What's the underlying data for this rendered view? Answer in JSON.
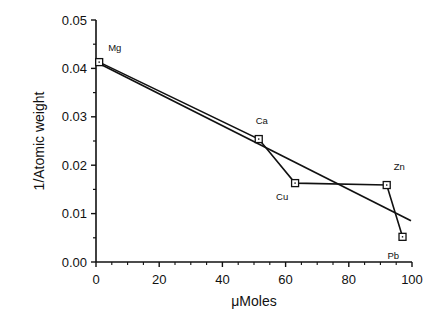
{
  "chart_data": {
    "type": "line",
    "title": "",
    "xlabel": "μMoles",
    "ylabel": "1/Atomic weight",
    "xlim": [
      0,
      100
    ],
    "ylim": [
      0.0,
      0.05
    ],
    "x_ticks": [
      "0",
      "20",
      "40",
      "60",
      "80",
      "100"
    ],
    "y_ticks": [
      "0.00",
      "0.01",
      "0.02",
      "0.03",
      "0.04",
      "0.05"
    ],
    "grid": false,
    "legend": null,
    "series": [
      {
        "name": "Metals",
        "style": "line with open square markers",
        "points": [
          {
            "label": "Mg",
            "x": 1,
            "y": 0.0413
          },
          {
            "label": "Ca",
            "x": 51.5,
            "y": 0.0254
          },
          {
            "label": "Cu",
            "x": 63,
            "y": 0.0163
          },
          {
            "label": "Zn",
            "x": 92,
            "y": 0.0159
          },
          {
            "label": "Pb",
            "x": 97,
            "y": 0.0052
          }
        ]
      },
      {
        "name": "Linear fit",
        "style": "straight line",
        "points": [
          {
            "x": 0,
            "y": 0.0413
          },
          {
            "x": 100,
            "y": 0.0085
          }
        ]
      }
    ]
  }
}
